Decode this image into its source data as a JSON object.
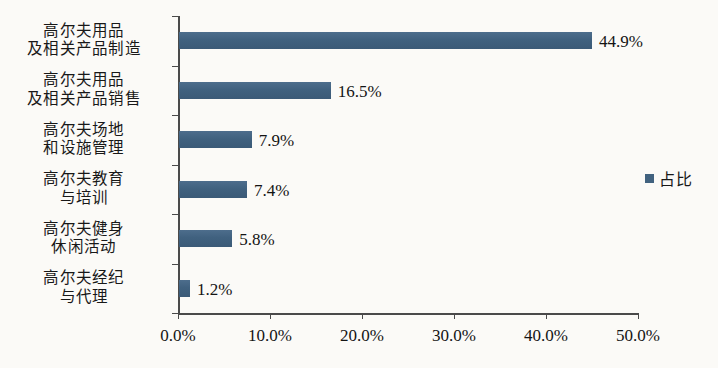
{
  "chart_data": {
    "type": "bar",
    "orientation": "horizontal",
    "title": "",
    "xlabel": "",
    "ylabel": "",
    "categories": [
      "高尔夫用品\n及相关产品制造",
      "高尔夫用品\n及相关产品销售",
      "高尔夫场地\n和设施管理",
      "高尔夫教育\n与培训",
      "高尔夫健身\n休闲活动",
      "高尔夫经纪\n与代理"
    ],
    "values": [
      44.9,
      16.5,
      7.9,
      7.4,
      5.8,
      1.2
    ],
    "value_labels": [
      "44.9%",
      "16.5%",
      "7.9%",
      "7.4%",
      "5.8%",
      "1.2%"
    ],
    "xlim": [
      0,
      50
    ],
    "xticks": [
      0,
      10,
      20,
      30,
      40,
      50
    ],
    "xtick_labels": [
      "0.0%",
      "10.0%",
      "20.0%",
      "30.0%",
      "40.0%",
      "50.0%"
    ],
    "grid": false,
    "legend": {
      "position": "right",
      "entries": [
        "占比"
      ]
    },
    "series": [
      {
        "name": "占比",
        "color": "#41627f",
        "values": [
          44.9,
          16.5,
          7.9,
          7.4,
          5.8,
          1.2
        ]
      }
    ]
  },
  "colors": {
    "bar": "#41627f",
    "axis": "#4a4a4a",
    "text": "#141414",
    "background": "#fbfaf7"
  }
}
